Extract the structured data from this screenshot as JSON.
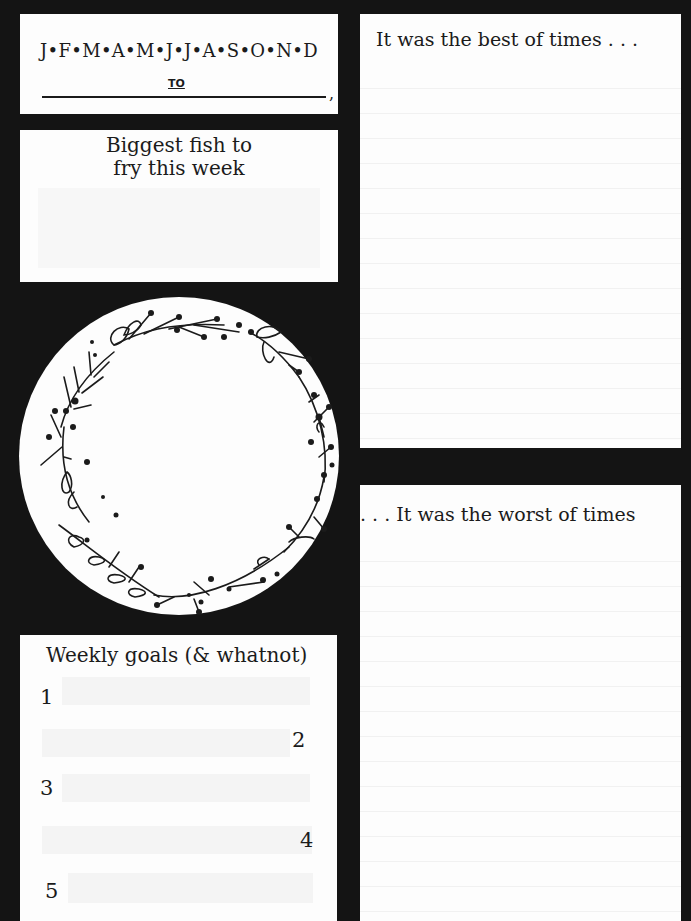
{
  "months_panel": {
    "months": "J•F•M•A•M•J•J•A•S•O•N•D",
    "to_label": "TO",
    "comma": ","
  },
  "fish_panel": {
    "title_line1": "Biggest fish to",
    "title_line2": "fry this week"
  },
  "wreath": {
    "icon": "floral-wreath-icon"
  },
  "goals_panel": {
    "title": "Weekly goals (& whatnot)",
    "goals": [
      {
        "number": "1"
      },
      {
        "number": "2"
      },
      {
        "number": "3"
      },
      {
        "number": "4"
      },
      {
        "number": "5"
      }
    ]
  },
  "best_panel": {
    "title": "It was the best of times . . ."
  },
  "worst_panel": {
    "title": ". . . It was the worst of times"
  },
  "colors": {
    "background": "#141414",
    "paper": "#fdfdfd",
    "ink": "#1b1b1b"
  }
}
